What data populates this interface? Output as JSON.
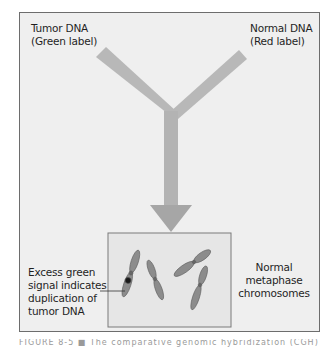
{
  "figure": {
    "labels": {
      "tumor_dna": {
        "line1": "Tumor DNA",
        "line2": "(Green label)"
      },
      "normal_dna": {
        "line1": "Normal DNA",
        "line2": "(Red label)"
      },
      "excess_signal": {
        "line1": "Excess green",
        "line2": "signal indicates",
        "line3": "duplication of",
        "line4": "tumor DNA"
      },
      "metaphase": {
        "line1": "Normal",
        "line2": "metaphase",
        "line3": "chromosomes"
      }
    },
    "caption": "FIGURE 8-5 ■ The comparative genomic hybridization (CGH)"
  },
  "colors": {
    "frame_bg": "#efefef",
    "frame_border": "#6d6d6d",
    "arrow": "#b3b3b3",
    "chromosome": "#8c8c8c",
    "highlight": "#1a1a1a"
  }
}
